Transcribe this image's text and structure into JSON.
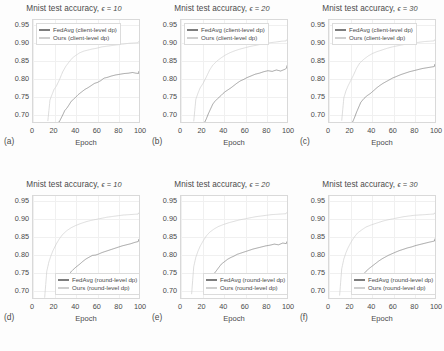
{
  "figure": {
    "axis": {
      "xlabel": "Epoch",
      "xticks": [
        "0",
        "20",
        "40",
        "60",
        "80",
        "100"
      ],
      "yticks": [
        "0.95",
        "0.90",
        "0.85",
        "0.80",
        "0.75",
        "0.70"
      ],
      "xlim": [
        0,
        100
      ],
      "ylim": [
        0.675,
        0.965
      ]
    },
    "colors": {
      "fedavg": "#7d7d7d",
      "ours": "#cfcfcf",
      "frame": "#d9d9d9",
      "grid": "#f0f0f0",
      "text": "#4a4a4a",
      "background": "#fdfdfd"
    },
    "panels": [
      {
        "letter": "(a)",
        "title_main": "Mnist test accuracy,",
        "title_eps": "ϵ = 10",
        "legend_position": "top",
        "legend": [
          {
            "label": "FedAvg (client-level dp)",
            "color": "#7d7d7d"
          },
          {
            "label": "Ours (client-level dp)",
            "color": "#cfcfcf"
          }
        ]
      },
      {
        "letter": "(b)",
        "title_main": "Mnist test accuracy,",
        "title_eps": "ϵ = 20",
        "legend_position": "top",
        "legend": [
          {
            "label": "FedAvg (client-level dp)",
            "color": "#7d7d7d"
          },
          {
            "label": "Ours (client-level dp)",
            "color": "#cfcfcf"
          }
        ]
      },
      {
        "letter": "(c)",
        "title_main": "Mnist test accuracy,",
        "title_eps": "ϵ = 30",
        "legend_position": "top",
        "legend": [
          {
            "label": "FedAvg (client-level dp)",
            "color": "#7d7d7d"
          },
          {
            "label": "Ours (client-level dp)",
            "color": "#cfcfcf"
          }
        ]
      },
      {
        "letter": "(d)",
        "title_main": "Mnist test accuracy,",
        "title_eps": "ϵ = 10",
        "legend_position": "bottom",
        "legend": [
          {
            "label": "FedAvg (round-level dp)",
            "color": "#7d7d7d"
          },
          {
            "label": "Ours (round-level dp)",
            "color": "#cfcfcf"
          }
        ]
      },
      {
        "letter": "(e)",
        "title_main": "Mnist test accuracy,",
        "title_eps": "ϵ = 20",
        "legend_position": "bottom",
        "legend": [
          {
            "label": "FedAvg (round-level dp)",
            "color": "#7d7d7d"
          },
          {
            "label": "Ours (round-level dp)",
            "color": "#cfcfcf"
          }
        ]
      },
      {
        "letter": "(f)",
        "title_main": "Mnist test accuracy,",
        "title_eps": "ϵ = 30",
        "legend_position": "bottom",
        "legend": [
          {
            "label": "FedAvg (round-level dp)",
            "color": "#7d7d7d"
          },
          {
            "label": "Ours (round-level dp)",
            "color": "#cfcfcf"
          }
        ]
      }
    ]
  },
  "chart_data": [
    {
      "type": "line",
      "panel": "(a)",
      "title": "Mnist test accuracy, ϵ = 10",
      "xlabel": "Epoch",
      "ylabel": "",
      "xlim": [
        0,
        100
      ],
      "ylim": [
        0.675,
        0.965
      ],
      "grid": true,
      "legend_position": "upper left",
      "series": [
        {
          "name": "Ours (client-level dp)",
          "x": [
            14,
            16,
            18,
            20,
            22,
            25,
            28,
            31,
            34,
            37,
            40,
            44,
            48,
            52,
            56,
            60,
            65,
            70,
            75,
            80,
            85,
            90,
            95,
            100
          ],
          "y": [
            0.682,
            0.742,
            0.758,
            0.773,
            0.781,
            0.8,
            0.822,
            0.838,
            0.85,
            0.861,
            0.868,
            0.876,
            0.881,
            0.884,
            0.887,
            0.889,
            0.893,
            0.895,
            0.897,
            0.899,
            0.901,
            0.903,
            0.904,
            0.905
          ]
        },
        {
          "name": "FedAvg (client-level dp)",
          "x": [
            24,
            26,
            28,
            30,
            32,
            34,
            36,
            38,
            40,
            43,
            46,
            49,
            52,
            55,
            58,
            61,
            64,
            67,
            70,
            74,
            78,
            82,
            86,
            90,
            94,
            97,
            100
          ],
          "y": [
            0.678,
            0.69,
            0.702,
            0.715,
            0.722,
            0.731,
            0.741,
            0.746,
            0.752,
            0.761,
            0.768,
            0.775,
            0.78,
            0.786,
            0.792,
            0.795,
            0.8,
            0.807,
            0.809,
            0.813,
            0.816,
            0.818,
            0.82,
            0.821,
            0.823,
            0.821,
            0.82
          ]
        }
      ]
    },
    {
      "type": "line",
      "panel": "(b)",
      "title": "Mnist test accuracy, ϵ = 20",
      "xlabel": "Epoch",
      "ylabel": "",
      "xlim": [
        0,
        100
      ],
      "ylim": [
        0.675,
        0.965
      ],
      "grid": true,
      "legend_position": "upper left",
      "series": [
        {
          "name": "Ours (client-level dp)",
          "x": [
            12,
            14,
            16,
            18,
            21,
            24,
            27,
            30,
            34,
            38,
            42,
            46,
            50,
            55,
            60,
            65,
            70,
            75,
            80,
            85,
            90,
            95,
            100
          ],
          "y": [
            0.681,
            0.744,
            0.761,
            0.776,
            0.79,
            0.808,
            0.827,
            0.841,
            0.853,
            0.862,
            0.87,
            0.876,
            0.881,
            0.886,
            0.89,
            0.894,
            0.897,
            0.9,
            0.903,
            0.905,
            0.907,
            0.909,
            0.91
          ]
        },
        {
          "name": "FedAvg (client-level dp)",
          "x": [
            22,
            24,
            26,
            28,
            30,
            32,
            35,
            38,
            41,
            44,
            47,
            50,
            53,
            56,
            59,
            62,
            66,
            70,
            74,
            78,
            82,
            86,
            90,
            94,
            98,
            100
          ],
          "y": [
            0.679,
            0.692,
            0.707,
            0.72,
            0.733,
            0.741,
            0.75,
            0.758,
            0.767,
            0.773,
            0.779,
            0.786,
            0.793,
            0.799,
            0.803,
            0.808,
            0.813,
            0.818,
            0.821,
            0.825,
            0.828,
            0.826,
            0.83,
            0.827,
            0.832,
            0.836
          ]
        }
      ]
    },
    {
      "type": "line",
      "panel": "(c)",
      "title": "Mnist test accuracy, ϵ = 30",
      "xlabel": "Epoch",
      "ylabel": "",
      "xlim": [
        0,
        100
      ],
      "ylim": [
        0.675,
        0.965
      ],
      "grid": true,
      "legend_position": "upper left",
      "series": [
        {
          "name": "Ours (client-level dp)",
          "x": [
            12,
            14,
            16,
            18,
            20,
            23,
            26,
            29,
            33,
            37,
            41,
            45,
            50,
            55,
            60,
            65,
            70,
            75,
            80,
            85,
            90,
            95,
            100
          ],
          "y": [
            0.683,
            0.748,
            0.768,
            0.782,
            0.794,
            0.812,
            0.832,
            0.847,
            0.858,
            0.867,
            0.874,
            0.879,
            0.884,
            0.889,
            0.893,
            0.896,
            0.899,
            0.902,
            0.904,
            0.906,
            0.908,
            0.909,
            0.91
          ]
        },
        {
          "name": "FedAvg (client-level dp)",
          "x": [
            22,
            24,
            26,
            28,
            30,
            33,
            36,
            39,
            42,
            45,
            48,
            51,
            54,
            57,
            60,
            64,
            68,
            72,
            76,
            80,
            84,
            88,
            92,
            96,
            100
          ],
          "y": [
            0.68,
            0.694,
            0.71,
            0.724,
            0.738,
            0.749,
            0.757,
            0.763,
            0.771,
            0.779,
            0.786,
            0.792,
            0.797,
            0.802,
            0.807,
            0.812,
            0.817,
            0.821,
            0.825,
            0.828,
            0.831,
            0.834,
            0.836,
            0.838,
            0.84
          ]
        }
      ]
    },
    {
      "type": "line",
      "panel": "(d)",
      "title": "Mnist test accuracy, ϵ = 10",
      "xlabel": "Epoch",
      "ylabel": "",
      "xlim": [
        0,
        100
      ],
      "ylim": [
        0.675,
        0.965
      ],
      "grid": true,
      "legend_position": "lower center",
      "series": [
        {
          "name": "Ours (round-level dp)",
          "x": [
            11,
            13,
            15,
            17,
            19,
            22,
            25,
            28,
            32,
            36,
            40,
            45,
            50,
            55,
            60,
            65,
            70,
            75,
            80,
            85,
            90,
            95,
            100
          ],
          "y": [
            0.68,
            0.755,
            0.782,
            0.8,
            0.815,
            0.833,
            0.848,
            0.86,
            0.871,
            0.879,
            0.885,
            0.891,
            0.896,
            0.9,
            0.903,
            0.906,
            0.909,
            0.911,
            0.913,
            0.915,
            0.916,
            0.917,
            0.918
          ]
        },
        {
          "name": "FedAvg (round-level dp)",
          "x": [
            28,
            30,
            32,
            34,
            36,
            38,
            41,
            44,
            47,
            50,
            53,
            56,
            59,
            62,
            65,
            68,
            72,
            76,
            80,
            84,
            88,
            92,
            96,
            100
          ],
          "y": [
            0.722,
            0.73,
            0.741,
            0.748,
            0.757,
            0.763,
            0.771,
            0.778,
            0.786,
            0.793,
            0.798,
            0.803,
            0.804,
            0.807,
            0.811,
            0.814,
            0.818,
            0.822,
            0.826,
            0.83,
            0.833,
            0.836,
            0.84,
            0.843
          ]
        }
      ]
    },
    {
      "type": "line",
      "panel": "(e)",
      "title": "Mnist test accuracy, ϵ = 20",
      "xlabel": "Epoch",
      "ylabel": "",
      "xlim": [
        0,
        100
      ],
      "ylim": [
        0.675,
        0.965
      ],
      "grid": true,
      "legend_position": "lower center",
      "series": [
        {
          "name": "Ours (round-level dp)",
          "x": [
            10,
            12,
            14,
            16,
            18,
            21,
            24,
            27,
            31,
            35,
            40,
            45,
            50,
            55,
            60,
            65,
            70,
            75,
            80,
            85,
            90,
            95,
            100
          ],
          "y": [
            0.69,
            0.768,
            0.795,
            0.812,
            0.826,
            0.842,
            0.856,
            0.866,
            0.875,
            0.882,
            0.888,
            0.893,
            0.897,
            0.901,
            0.904,
            0.907,
            0.91,
            0.912,
            0.914,
            0.916,
            0.917,
            0.918,
            0.919
          ]
        },
        {
          "name": "FedAvg (round-level dp)",
          "x": [
            30,
            32,
            34,
            36,
            38,
            41,
            44,
            47,
            50,
            53,
            56,
            59,
            62,
            65,
            68,
            72,
            76,
            80,
            84,
            88,
            92,
            96,
            100
          ],
          "y": [
            0.748,
            0.754,
            0.762,
            0.77,
            0.778,
            0.785,
            0.792,
            0.797,
            0.801,
            0.806,
            0.809,
            0.812,
            0.815,
            0.818,
            0.821,
            0.824,
            0.827,
            0.83,
            0.832,
            0.835,
            0.833,
            0.838,
            0.836
          ]
        }
      ]
    },
    {
      "type": "line",
      "panel": "(f)",
      "title": "Mnist test accuracy, ϵ = 30",
      "xlabel": "Epoch",
      "ylabel": "",
      "xlim": [
        0,
        100
      ],
      "ylim": [
        0.675,
        0.965
      ],
      "grid": true,
      "legend_position": "lower center",
      "series": [
        {
          "name": "Ours (round-level dp)",
          "x": [
            10,
            12,
            14,
            16,
            18,
            21,
            24,
            27,
            31,
            35,
            40,
            45,
            50,
            55,
            60,
            65,
            70,
            75,
            80,
            85,
            90,
            95,
            100
          ],
          "y": [
            0.686,
            0.762,
            0.79,
            0.808,
            0.822,
            0.839,
            0.853,
            0.864,
            0.873,
            0.881,
            0.887,
            0.892,
            0.897,
            0.901,
            0.904,
            0.907,
            0.91,
            0.912,
            0.914,
            0.915,
            0.916,
            0.917,
            0.918
          ]
        },
        {
          "name": "FedAvg (round-level dp)",
          "x": [
            27,
            29,
            31,
            33,
            35,
            38,
            41,
            44,
            47,
            50,
            53,
            56,
            59,
            62,
            66,
            70,
            74,
            78,
            82,
            86,
            90,
            94,
            97,
            100
          ],
          "y": [
            0.73,
            0.736,
            0.744,
            0.751,
            0.758,
            0.766,
            0.773,
            0.78,
            0.787,
            0.793,
            0.798,
            0.803,
            0.807,
            0.811,
            0.816,
            0.82,
            0.824,
            0.827,
            0.831,
            0.834,
            0.837,
            0.84,
            0.842,
            0.844
          ]
        }
      ]
    }
  ]
}
